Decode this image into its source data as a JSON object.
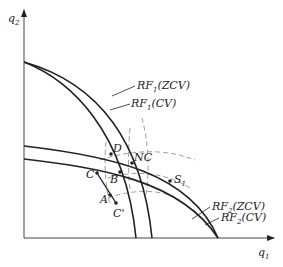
{
  "axes": {
    "y_label": "q",
    "y_label_sub": "2",
    "x_label": "q",
    "x_label_sub": "1"
  },
  "curves": {
    "rf1_zcv": {
      "name": "RF",
      "sub": "1",
      "suffix": "(ZCV)"
    },
    "rf1_cv": {
      "name": "RF",
      "sub": "1",
      "suffix": "(CV)"
    },
    "rf2_zcv": {
      "name": "RF",
      "sub": "2",
      "suffix": "(ZCV)"
    },
    "rf2_cv": {
      "name": "RF",
      "sub": "2",
      "suffix": "(CV)"
    }
  },
  "points": {
    "D": "D",
    "NC": "NC",
    "C": "C",
    "B": "B",
    "S1": "S",
    "S1_sub": "1",
    "A": "A",
    "C_prime": "C'"
  },
  "colors": {
    "ink": "#222222",
    "dashed": "#888888",
    "background": "#ffffff"
  }
}
